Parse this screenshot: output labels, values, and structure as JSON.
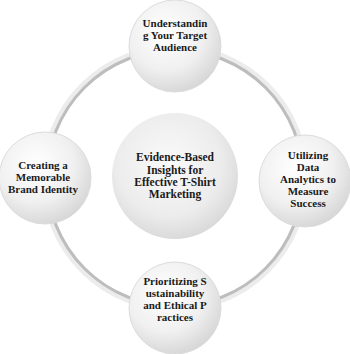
{
  "diagram": {
    "type": "cycle",
    "colors": {
      "ring": "#b8b8b8",
      "ring_highlight": "#e6e6e6",
      "node_fill_light": "#fbfbfb",
      "node_fill_dark": "#d2d2d2",
      "text": "#1a1a1a"
    },
    "center": {
      "label": "Evidence-Based Insights for Effective T-Shirt Marketing"
    },
    "nodes": [
      {
        "id": "top",
        "label": "Understanding Your Target Audience"
      },
      {
        "id": "right",
        "label": "Utilizing Data Analytics to Measure Success"
      },
      {
        "id": "bottom",
        "label": "Prioritizing Sustainability and Ethical Practices"
      },
      {
        "id": "left",
        "label": "Creating a Memorable Brand Identity"
      }
    ]
  }
}
